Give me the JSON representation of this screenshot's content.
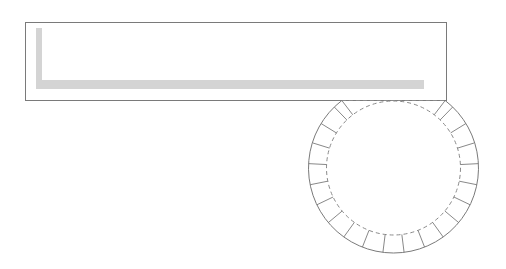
{
  "diagram": {
    "kind": "paper-craft cylinder template",
    "colors": {
      "background": "#ffffff",
      "outline": "#7a7a7a",
      "dashed_fold": "#8a8a8a",
      "glue_strip": "#d4d4d4"
    },
    "body_panel": {
      "x": 25,
      "y": 22,
      "width": 421,
      "height": 78
    },
    "glue_strip": {
      "vertical": {
        "x": 36,
        "y": 28,
        "width": 6,
        "height": 61
      },
      "horizontal": {
        "x": 36,
        "y": 80,
        "width": 388,
        "height": 9
      }
    },
    "base_circle": {
      "cx": 393.5,
      "cy": 168,
      "outer_radius": 85,
      "inner_radius": 67,
      "fold_line_y": 100,
      "tab_divider_step_deg": 14.3,
      "tab_count": 20
    }
  }
}
